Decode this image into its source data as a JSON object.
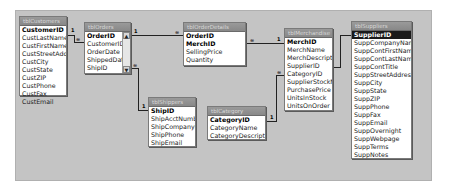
{
  "tables": {
    "customers": {
      "title": "tblCustomers",
      "fields": [
        "CustomerID",
        "CustLastName",
        "CustFirstName",
        "CustStreetAddrss",
        "CustCity",
        "CustState",
        "CustZIP",
        "CustPhone",
        "CustFax",
        "CustEmail"
      ]
    },
    "orders": {
      "title": "tblOrders",
      "fields": [
        "OrderID",
        "CustomerID",
        "OrderDate",
        "ShippedDate",
        "ShipID"
      ],
      "scroll_up": "▲",
      "scroll_down": "▼"
    },
    "order_details": {
      "title": "tblOrderDetails",
      "fields": [
        "OrderID",
        "MerchID",
        "SellingPrice",
        "Quantity"
      ]
    },
    "merchandise": {
      "title": "tblMerchandise",
      "fields": [
        "MerchID",
        "MerchName",
        "MerchDescription",
        "SupplierID",
        "CategoryID",
        "SupplierStockNum",
        "PurchasePrice",
        "UnitsInStock",
        "UnitsOnOrder"
      ]
    },
    "suppliers": {
      "title": "tblSuppliers",
      "fields": [
        "SupplierID",
        "SuppCompanyName",
        "SuppContFirstName",
        "SuppContLastName",
        "SuppContTitle",
        "SuppStreetAddress",
        "SuppCity",
        "SuppState",
        "SuppZIP",
        "SuppPhone",
        "SuppFax",
        "SuppEmail",
        "SuppOvernight",
        "SuppWebpage",
        "SuppTerms",
        "SuppNotes"
      ]
    },
    "shippers": {
      "title": "tblShippers",
      "fields": [
        "ShipID",
        "ShipAcctNumber",
        "ShipCompanyName",
        "ShipPhone",
        "ShipEmail"
      ]
    },
    "category": {
      "title": "tblCategory",
      "fields": [
        "CategoryID",
        "CategoryName",
        "CategoryDescription"
      ]
    }
  },
  "relationships": {
    "one": "1",
    "many": "∞"
  }
}
